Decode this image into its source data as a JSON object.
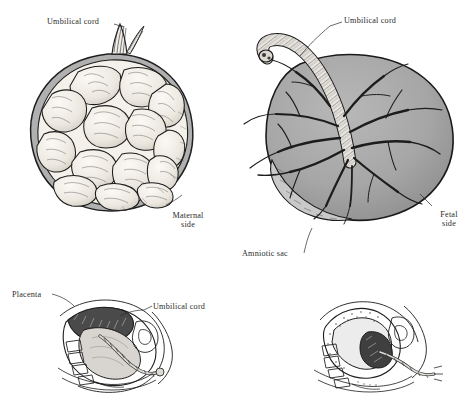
{
  "figure": {
    "background_color": "#ffffff",
    "ink_color": "#1a1a1a",
    "tissue_gray": "#a8a8a8",
    "membrane_gray": "#b4b4b4",
    "cotyledon_fill": "#f2efe9"
  },
  "panels": {
    "maternal": {
      "name": "Maternal side placenta",
      "caption_line1": "Maternal",
      "caption_line2": "side",
      "cord_label": "Umbilical cord",
      "cotyledon_count": 14
    },
    "fetal": {
      "name": "Fetal side placenta",
      "caption_line1": "Fetal",
      "caption_line2": "side",
      "cord_label": "Umbilical cord",
      "membrane_label": "Amniotic sac",
      "vessel_branch_count": 12
    },
    "section_left": {
      "name": "Sagittal uterine section with placenta",
      "placenta_label": "Placenta",
      "cord_label": "Umbilical cord"
    },
    "section_right": {
      "name": "Sagittal uterine section, delivery of placenta"
    }
  }
}
